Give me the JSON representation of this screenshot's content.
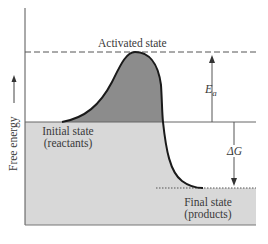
{
  "diagram": {
    "y_axis_label": "Free energy",
    "labels": {
      "activated_state": "Activated state",
      "initial_state_line1": "Initial state",
      "initial_state_line2": "(reactants)",
      "final_state_line1": "Final state",
      "final_state_line2": "(products)",
      "activation_energy": "E",
      "activation_energy_sub": "a",
      "delta_g": "ΔG"
    },
    "colors": {
      "reactant_fill": "#d6d6d6",
      "barrier_fill": "#8a8a8a",
      "curve": "#1a1a1a",
      "lines": "#555555",
      "text": "#3a3a3a"
    },
    "levels": {
      "activated": "high",
      "initial": "middle",
      "final": "low"
    }
  }
}
